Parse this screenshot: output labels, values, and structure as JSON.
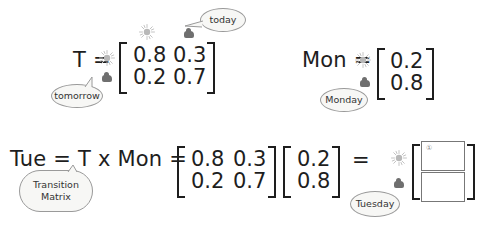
{
  "diagram": {
    "transition": {
      "label": "T =",
      "matrix": [
        [
          "0.8",
          "0.3"
        ],
        [
          "0.2",
          "0.7"
        ]
      ],
      "callout_today": "today",
      "callout_tomorrow": "tomorrow",
      "icons": [
        "sun-icon",
        "cloud-icon"
      ]
    },
    "monday": {
      "label": "Mon =",
      "vector": [
        "0.2",
        "0.8"
      ],
      "callout": "Monday",
      "icons": [
        "sun-icon",
        "cloud-icon"
      ]
    },
    "tuesday": {
      "label": "Tue = T x Mon =",
      "matrix": [
        [
          "0.8",
          "0.3"
        ],
        [
          "0.2",
          "0.7"
        ]
      ],
      "vector": [
        "0.2",
        "0.8"
      ],
      "equals": "=",
      "callout_transition": "Transition Matrix",
      "callout_tuesday": "Tuesday",
      "result_marker": "①",
      "result_cells": [
        "",
        ""
      ],
      "icons": [
        "sun-icon",
        "cloud-icon"
      ]
    },
    "colors": {
      "text": "#1e1e1e",
      "bubble_fill": "#f7f7f5",
      "bubble_border": "#9a9a9a",
      "sun": "#bdbdbd",
      "cloud": "#6f6f6f"
    }
  }
}
